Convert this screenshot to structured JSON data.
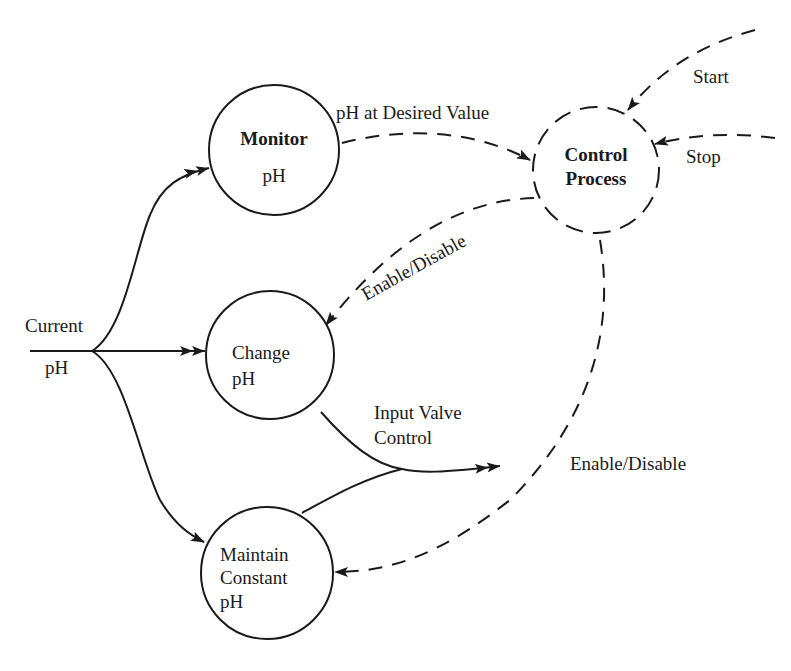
{
  "diagram": {
    "type": "data-flow / control-flow diagram",
    "nodes": [
      {
        "id": "monitor",
        "line1": "Monitor",
        "line2": "pH",
        "style": "solid",
        "bold": true
      },
      {
        "id": "change",
        "line1": "Change",
        "line2": "pH",
        "style": "solid",
        "bold": false
      },
      {
        "id": "maintain",
        "line1": "Maintain",
        "line2": "Constant",
        "line3": "pH",
        "style": "solid",
        "bold": false
      },
      {
        "id": "control",
        "line1": "Control",
        "line2": "Process",
        "style": "dashed",
        "bold": true
      }
    ],
    "flows": {
      "input_label_line1": "Current",
      "input_label_line2": "pH",
      "monitor_to_control": "pH at Desired Value",
      "control_to_change": "Enable/Disable",
      "control_to_maintain": "Enable/Disable",
      "output": "Input Valve Control",
      "output_line1": "Input Valve",
      "output_line2": "Control",
      "start": "Start",
      "stop": "Stop"
    },
    "edges": [
      {
        "from": "Current pH",
        "to": "monitor",
        "style": "solid"
      },
      {
        "from": "Current pH",
        "to": "change",
        "style": "solid"
      },
      {
        "from": "Current pH",
        "to": "maintain",
        "style": "solid"
      },
      {
        "from": "monitor",
        "to": "control",
        "label": "pH at Desired Value",
        "style": "dashed"
      },
      {
        "from": "control",
        "to": "change",
        "label": "Enable/Disable",
        "style": "dashed"
      },
      {
        "from": "control",
        "to": "maintain",
        "label": "Enable/Disable",
        "style": "dashed"
      },
      {
        "from": "change",
        "to": "output",
        "label": "Input Valve Control",
        "style": "solid"
      },
      {
        "from": "maintain",
        "to": "output",
        "label": "Input Valve Control",
        "style": "solid"
      },
      {
        "from": "external",
        "to": "control",
        "label": "Start",
        "style": "dashed"
      },
      {
        "from": "external",
        "to": "control",
        "label": "Stop",
        "style": "dashed"
      }
    ]
  }
}
